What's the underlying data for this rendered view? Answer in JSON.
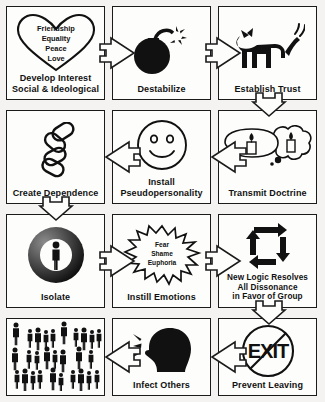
{
  "diagram": {
    "type": "flowchart",
    "grid": {
      "columns": 3,
      "rows": 4,
      "flow": "serpentine"
    },
    "colors": {
      "background": "#f4f3f1",
      "cell_fill": "#fdfdfc",
      "stroke": "#1b1b1b",
      "art": "#111111"
    }
  },
  "steps": [
    {
      "id": "develop-interest",
      "label": "Develop Interest\nSocial & Ideological",
      "icon": "heart-icon",
      "inner_words": [
        "Friendship",
        "Equality",
        "Peace",
        "Love"
      ]
    },
    {
      "id": "destabilize",
      "label": "Destabilize",
      "icon": "bomb-icon",
      "inner_words": []
    },
    {
      "id": "establish-trust",
      "label": "Establish Trust",
      "icon": "dog-icon",
      "inner_words": []
    },
    {
      "id": "transmit-doctrine",
      "label": "Transmit Doctrine",
      "icon": "speech-thought-bubble-candles-icon",
      "inner_words": []
    },
    {
      "id": "install-pseudopersonality",
      "label": "Install\nPseudopersonality",
      "icon": "smiley-face-icon",
      "inner_words": []
    },
    {
      "id": "create-dependence",
      "label": "Create Dependence",
      "icon": "chain-links-icon",
      "inner_words": []
    },
    {
      "id": "isolate",
      "label": "Isolate",
      "icon": "person-in-ring-icon",
      "inner_words": []
    },
    {
      "id": "instill-emotions",
      "label": "Instill Emotions",
      "icon": "starburst-icon",
      "inner_words": [
        "Fear",
        "Shame",
        "Euphoria"
      ]
    },
    {
      "id": "new-logic-resolves",
      "label": "New Logic Resolves\nAll Dissonance\nin Favor of Group",
      "icon": "loop-arrows-icon",
      "inner_words": []
    },
    {
      "id": "prevent-leaving",
      "label": "Prevent Leaving",
      "icon": "no-exit-icon",
      "inner_words": [
        "EXIT"
      ]
    },
    {
      "id": "infect-others",
      "label": "Infect Others",
      "icon": "speaking-head-icon",
      "inner_words": []
    },
    {
      "id": "crowd",
      "label": "",
      "icon": "crowd-of-people-icon",
      "inner_words": []
    }
  ]
}
